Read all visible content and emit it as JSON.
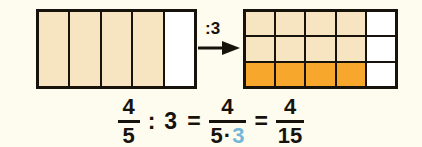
{
  "diagram": {
    "background_color": "#fdfcef",
    "stroke_color": "#17120b",
    "colors": {
      "tan": "#f6e5c0",
      "orange": "#f7a82c",
      "white": "#ffffff",
      "highlight_blue": "#74b6d8"
    },
    "left_model": {
      "name": "four-fifths-bar",
      "columns": 5,
      "rows": 1,
      "cells": [
        {
          "fill": "tan"
        },
        {
          "fill": "tan"
        },
        {
          "fill": "tan"
        },
        {
          "fill": "tan"
        },
        {
          "fill": "white"
        }
      ]
    },
    "operator": {
      "label": ":3",
      "arrow": "right-arrow"
    },
    "right_model": {
      "name": "four-fifteenths-grid",
      "columns": 5,
      "rows": 3,
      "cells": [
        {
          "fill": "tan"
        },
        {
          "fill": "tan"
        },
        {
          "fill": "tan"
        },
        {
          "fill": "tan"
        },
        {
          "fill": "white"
        },
        {
          "fill": "tan"
        },
        {
          "fill": "tan"
        },
        {
          "fill": "tan"
        },
        {
          "fill": "tan"
        },
        {
          "fill": "white"
        },
        {
          "fill": "orange"
        },
        {
          "fill": "orange"
        },
        {
          "fill": "orange"
        },
        {
          "fill": "orange"
        },
        {
          "fill": "white"
        }
      ]
    }
  },
  "equation": {
    "text": "4/5 : 3 = 4/(5·3) = 4/15",
    "fraction1": {
      "numerator": "4",
      "denominator": "5"
    },
    "divide_symbol": ":",
    "divisor": "3",
    "equals1": "=",
    "fraction2": {
      "numerator": "4",
      "denominator_left": "5",
      "denominator_dot": "·",
      "denominator_right": "3"
    },
    "equals2": "=",
    "fraction3": {
      "numerator": "4",
      "denominator": "15"
    }
  }
}
